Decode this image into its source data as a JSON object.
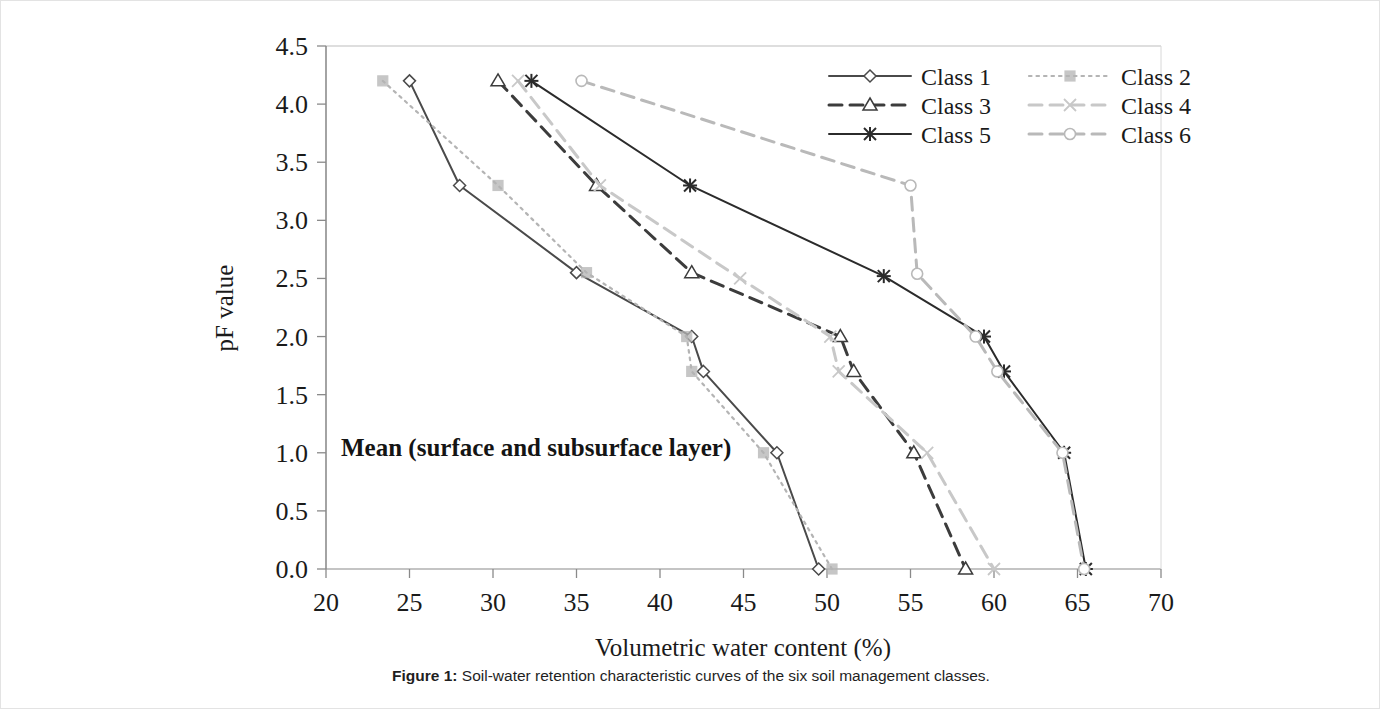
{
  "figure": {
    "caption_label": "Figure 1:",
    "caption_text": " Soil-water retention characteristic curves of the six soil management classes."
  },
  "annotation": {
    "text": "Mean (surface and subsurface layer)"
  },
  "chart_data": {
    "type": "line",
    "title": "",
    "xlabel": "Volumetric water content (%)",
    "ylabel": "pF value",
    "xlim": [
      20,
      70
    ],
    "ylim": [
      0.0,
      4.5
    ],
    "xticks": [
      20,
      25,
      30,
      35,
      40,
      45,
      50,
      55,
      60,
      65,
      70
    ],
    "xtick_labels": [
      "20",
      "25",
      "30",
      "35",
      "40",
      "45",
      "50",
      "55",
      "60",
      "65",
      "70"
    ],
    "yticks": [
      0.0,
      0.5,
      1.0,
      1.5,
      2.0,
      2.5,
      3.0,
      3.5,
      4.0,
      4.5
    ],
    "ytick_labels": [
      "0.0",
      "0.5",
      "1.0",
      "1.5",
      "2.0",
      "2.5",
      "3.0",
      "3.5",
      "4.0",
      "4.5"
    ],
    "grid": false,
    "legend_position": "top-right",
    "note": "x = volumetric water content (%), y = pF value; curves descend from pF 4.2 to pF 0.0",
    "series": [
      {
        "name": "Class 1",
        "color": "#4a4a4a",
        "dash": "none",
        "marker": "diamond",
        "x": [
          25.0,
          28.0,
          35.0,
          41.9,
          42.6,
          47.0,
          49.5
        ],
        "y": [
          4.2,
          3.3,
          2.55,
          2.0,
          1.7,
          1.0,
          0.0
        ]
      },
      {
        "name": "Class 2",
        "color": "#b4b4b4",
        "dash": "dotted",
        "marker": "square",
        "x": [
          23.4,
          30.3,
          35.6,
          41.6,
          41.9,
          46.2,
          50.3
        ],
        "y": [
          4.2,
          3.3,
          2.55,
          2.0,
          1.7,
          1.0,
          0.0
        ]
      },
      {
        "name": "Class 3",
        "color": "#3c3c3c",
        "dash": "dashed",
        "marker": "triangle",
        "x": [
          30.3,
          36.2,
          41.9,
          50.8,
          51.6,
          55.2,
          58.3
        ],
        "y": [
          4.2,
          3.3,
          2.55,
          2.0,
          1.7,
          1.0,
          0.0
        ]
      },
      {
        "name": "Class 4",
        "color": "#c8c8c8",
        "dash": "dashed",
        "marker": "cross",
        "x": [
          31.5,
          36.4,
          44.8,
          50.2,
          50.7,
          56.0,
          60.0
        ],
        "y": [
          4.2,
          3.3,
          2.5,
          2.0,
          1.7,
          1.0,
          0.0
        ]
      },
      {
        "name": "Class 5",
        "color": "#2b2b2b",
        "dash": "none",
        "marker": "star",
        "x": [
          32.3,
          41.8,
          53.4,
          59.4,
          60.6,
          64.2,
          65.5
        ],
        "y": [
          4.2,
          3.3,
          2.52,
          2.0,
          1.7,
          1.0,
          0.0
        ]
      },
      {
        "name": "Class 6",
        "color": "#b9b9b9",
        "dash": "dashed",
        "marker": "circle",
        "x": [
          35.3,
          55.0,
          55.4,
          58.9,
          60.2,
          64.1,
          65.4
        ],
        "y": [
          4.2,
          3.3,
          2.54,
          2.0,
          1.7,
          1.0,
          0.0
        ]
      }
    ],
    "legend": [
      {
        "label": "Class 1",
        "marker": "diamond",
        "dash": "none",
        "color": "#4a4a4a"
      },
      {
        "label": "Class 2",
        "marker": "square",
        "dash": "dotted",
        "color": "#b4b4b4"
      },
      {
        "label": "Class 3",
        "marker": "triangle",
        "dash": "dashed",
        "color": "#3c3c3c"
      },
      {
        "label": "Class 4",
        "marker": "cross",
        "dash": "dashed",
        "color": "#c8c8c8"
      },
      {
        "label": "Class 5",
        "marker": "star",
        "dash": "none",
        "color": "#2b2b2b"
      },
      {
        "label": "Class 6",
        "marker": "circle",
        "dash": "dashed",
        "color": "#b9b9b9"
      }
    ]
  }
}
